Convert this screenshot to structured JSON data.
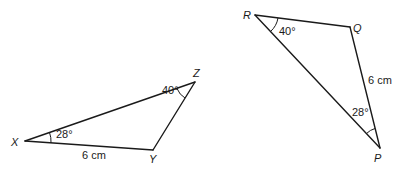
{
  "triangles": [
    {
      "name": "XYZ",
      "vertices": {
        "X": {
          "label": "X"
        },
        "Y": {
          "label": "Y"
        },
        "Z": {
          "label": "Z"
        }
      },
      "angles": {
        "X": "28°",
        "Z": "40°"
      },
      "sides": {
        "XY": "6 cm"
      }
    },
    {
      "name": "PQR",
      "vertices": {
        "P": {
          "label": "P"
        },
        "Q": {
          "label": "Q"
        },
        "R": {
          "label": "R"
        }
      },
      "angles": {
        "R": "40°",
        "P": "28°"
      },
      "sides": {
        "QP": "6 cm"
      }
    }
  ]
}
